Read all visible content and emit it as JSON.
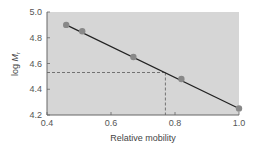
{
  "chart_data": {
    "type": "scatter",
    "title": "",
    "xlabel": "Relative mobility",
    "ylabel": "log Mr",
    "ylabel_main": "log ",
    "ylabel_italic": "M",
    "ylabel_sub": "r",
    "xlim": [
      0.4,
      1.0
    ],
    "ylim": [
      4.2,
      5.0
    ],
    "xticks": [
      "0.4",
      "0.6",
      "0.8",
      "1.0"
    ],
    "yticks": [
      "4.2",
      "4.4",
      "4.6",
      "4.8",
      "5.0"
    ],
    "grid": false,
    "legend": null,
    "series": [
      {
        "name": "standards",
        "x": [
          0.46,
          0.51,
          0.67,
          0.82,
          1.0
        ],
        "y": [
          4.9,
          4.85,
          4.65,
          4.48,
          4.25
        ]
      }
    ],
    "fit_line": {
      "x": [
        0.46,
        1.0
      ],
      "y": [
        4.9,
        4.25
      ]
    },
    "annotation": {
      "type": "dashed-lookup",
      "x": 0.77,
      "y": 4.53
    },
    "colors": {
      "plot_background": "#d6d6d6",
      "point": "#888888",
      "line": "#222222",
      "dashed": "#666666"
    }
  }
}
